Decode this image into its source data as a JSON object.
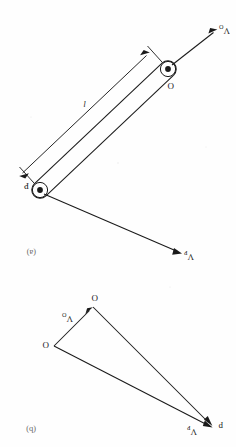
{
  "figure": {
    "orientation_note": "scanned page printed upside down (rotated 180 degrees)",
    "ink_color": "#1a1a1a",
    "background_color": "#fefefe"
  },
  "panels": [
    {
      "id": "panel-a",
      "label": "(a)",
      "caption": "rigid link OP",
      "points": [
        {
          "name": "O",
          "label": "O",
          "x": 68,
          "y": 378,
          "kind": "pivot"
        },
        {
          "name": "P",
          "label": "P",
          "x": 196,
          "y": 257,
          "kind": "pivot"
        }
      ],
      "dimension": {
        "label": "l",
        "from": "O",
        "to": "P"
      },
      "vectors": [
        {
          "name": "v-o",
          "label": "V",
          "sub": "O",
          "from": "O",
          "direction": "down-left"
        },
        {
          "name": "v-p",
          "label": "V",
          "sub": "P",
          "from": "P",
          "direction": "up-left"
        }
      ]
    },
    {
      "id": "panel-b",
      "label": "(b)",
      "caption": "velocity diagram",
      "points": [
        {
          "name": "o",
          "label": "o",
          "x": 182,
          "y": 101,
          "kind": "pole"
        },
        {
          "name": "o-prime",
          "label": "o",
          "x": 143,
          "y": 140,
          "kind": "node"
        },
        {
          "name": "p",
          "label": "p",
          "x": 22,
          "y": 20,
          "kind": "node"
        }
      ],
      "vectors": [
        {
          "name": "v-o",
          "label": "V",
          "sub": "O",
          "from": "o",
          "to": "o-prime"
        },
        {
          "name": "v-p-from-pole",
          "label": "V",
          "sub": "P",
          "from": "o",
          "to": "p"
        },
        {
          "name": "relative-velocity",
          "from": "o-prime",
          "to": "p"
        }
      ]
    }
  ],
  "labels": {
    "panel_a": "(a)",
    "panel_b": "(b)",
    "point_O_upper": "O",
    "point_O_lower": "O",
    "point_P": "P",
    "point_p_lower": "p",
    "length_l": "l",
    "velocity_symbol": "V",
    "sub_O": "O",
    "sub_P": "P"
  }
}
